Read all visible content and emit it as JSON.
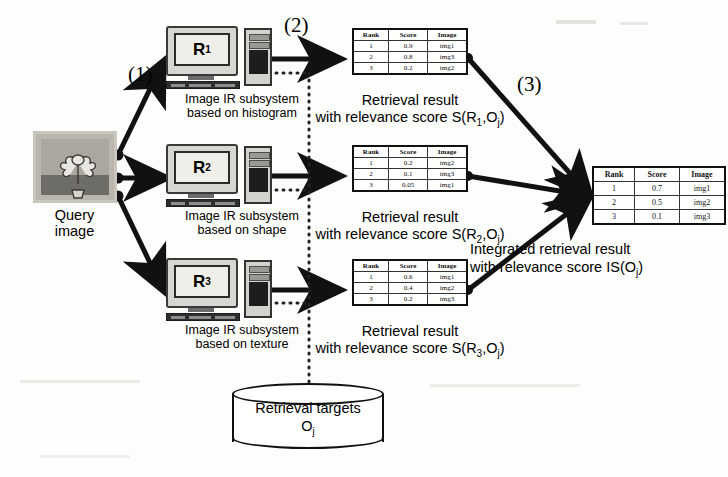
{
  "diagram": {
    "steps": [
      {
        "id": "step1",
        "label": "(1)"
      },
      {
        "id": "step2",
        "label": "(2)"
      },
      {
        "id": "step3",
        "label": "(3)"
      }
    ],
    "query": {
      "label_line1": "Query",
      "label_line2": "image",
      "thumbnail_alt": "flower pot photo"
    },
    "subsystems": [
      {
        "id": "R1",
        "screen_label": "R",
        "screen_sub": "1",
        "caption_line1": "Image IR subsystem",
        "caption_line2": "based on histogram"
      },
      {
        "id": "R2",
        "screen_label": "R",
        "screen_sub": "2",
        "caption_line1": "Image IR subsystem",
        "caption_line2": "based on shape"
      },
      {
        "id": "R3",
        "screen_label": "R",
        "screen_sub": "3",
        "caption_line1": "Image IR subsystem",
        "caption_line2": "based on texture"
      }
    ],
    "table_headers": [
      "Rank",
      "Score",
      "Image"
    ],
    "results": [
      {
        "id": "result_R1",
        "rows": [
          [
            "1",
            "0.9",
            "img1"
          ],
          [
            "2",
            "0.8",
            "img3"
          ],
          [
            "3",
            "0.2",
            "img2"
          ]
        ],
        "caption_line1": "Retrieval result",
        "caption_line2_pre": "with relevance score S(R",
        "caption_sub": "1",
        "caption_line2_post": ",O",
        "caption_sub2": "j",
        "caption_tail": ")"
      },
      {
        "id": "result_R2",
        "rows": [
          [
            "1",
            "0.2",
            "img2"
          ],
          [
            "2",
            "0.1",
            "img3"
          ],
          [
            "3",
            "0.05",
            "img1"
          ]
        ],
        "caption_line1": "Retrieval result",
        "caption_line2_pre": "with relevance score S(R",
        "caption_sub": "2",
        "caption_line2_post": ",O",
        "caption_sub2": "j",
        "caption_tail": ")"
      },
      {
        "id": "result_R3",
        "rows": [
          [
            "1",
            "0.6",
            "img1"
          ],
          [
            "2",
            "0.4",
            "img2"
          ],
          [
            "3",
            "0.2",
            "img3"
          ]
        ],
        "caption_line1": "Retrieval result",
        "caption_line2_pre": "with relevance score S(R",
        "caption_sub": "3",
        "caption_line2_post": ",O",
        "caption_sub2": "j",
        "caption_tail": ")"
      }
    ],
    "integrated": {
      "id": "integrated_result",
      "rows": [
        [
          "1",
          "0.7",
          "img1"
        ],
        [
          "2",
          "0.5",
          "img2"
        ],
        [
          "3",
          "0.1",
          "img3"
        ]
      ],
      "caption_line1": "Integrated retrieval result",
      "caption_line2_pre": "with relevance score IS(O",
      "caption_sub": "j",
      "caption_tail": ")"
    },
    "database": {
      "label_line1": "Retrieval targets",
      "label_line2_pre": "O",
      "label_sub": "j"
    },
    "colors": {
      "line": "#111111",
      "dotted": "#222222",
      "background": "#fdfdfb",
      "monitor_body": "#d8d6d0"
    }
  }
}
